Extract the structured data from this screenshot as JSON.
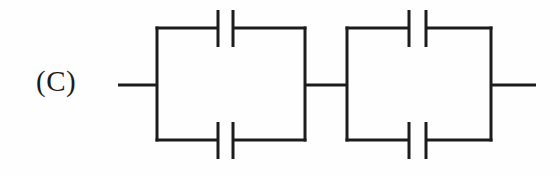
{
  "figure": {
    "label": "(C)",
    "background_color": "#fefefe",
    "ink_color": "#1c1c1c",
    "width": 559,
    "height": 176
  },
  "circuit": {
    "label": "(C)",
    "stroke_color": "#1c1c1c",
    "stroke_width": 3,
    "topology": "two-parallel-capacitor-blocks-in-series",
    "capacitor_count": 4,
    "leads": [
      {
        "name": "left-lead",
        "x1": 118,
        "y1": 85,
        "x2": 158,
        "y2": 85
      },
      {
        "name": "middle-lead",
        "x1": 305,
        "y1": 85,
        "x2": 347,
        "y2": 85
      },
      {
        "name": "right-lead",
        "x1": 491,
        "y1": 85,
        "x2": 536,
        "y2": 85
      }
    ],
    "blocks": [
      {
        "name": "block-1",
        "left": 157,
        "right": 305,
        "top": 28,
        "bottom": 140,
        "branches": [
          {
            "name": "block-1-top-branch",
            "wire_y": 28,
            "capacitor": {
              "name": "capacitor-c1",
              "plate_left_x": 218,
              "plate_right_x": 233,
              "plate_top_y": 10,
              "plate_bottom_y": 47
            }
          },
          {
            "name": "block-1-bottom-branch",
            "wire_y": 140,
            "capacitor": {
              "name": "capacitor-c2",
              "plate_left_x": 218,
              "plate_right_x": 233,
              "plate_top_y": 122,
              "plate_bottom_y": 159
            }
          }
        ]
      },
      {
        "name": "block-2",
        "left": 347,
        "right": 491,
        "top": 28,
        "bottom": 140,
        "branches": [
          {
            "name": "block-2-top-branch",
            "wire_y": 28,
            "capacitor": {
              "name": "capacitor-c3",
              "plate_left_x": 409,
              "plate_right_x": 426,
              "plate_top_y": 10,
              "plate_bottom_y": 47
            }
          },
          {
            "name": "block-2-bottom-branch",
            "wire_y": 140,
            "capacitor": {
              "name": "capacitor-c4",
              "plate_left_x": 409,
              "plate_right_x": 426,
              "plate_top_y": 122,
              "plate_bottom_y": 159
            }
          }
        ]
      }
    ]
  }
}
